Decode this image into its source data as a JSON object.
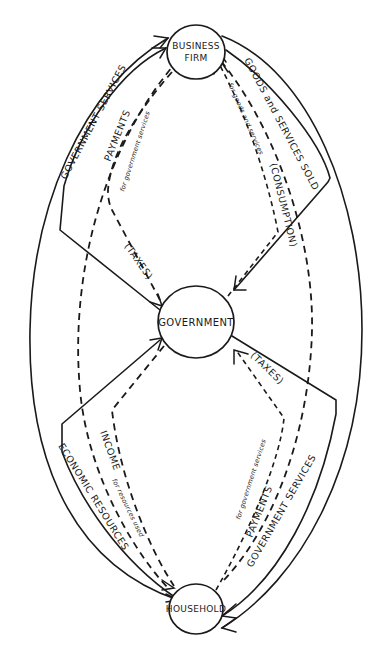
{
  "diagram": {
    "nodes": {
      "firm": {
        "line1": "BUSINESS",
        "line2": "FIRM"
      },
      "government": {
        "label": "GOVERNMENT"
      },
      "household": {
        "label": "HOUSEHOLD"
      }
    },
    "flows": {
      "gov_services_to_firm": {
        "label": "GOVERNMENT SERVICES",
        "style": "solid"
      },
      "firm_payments_to_gov": {
        "label": "PAYMENTS",
        "sublabel": "for government services",
        "style": "dashed"
      },
      "firm_taxes": {
        "label": "(TAXES)",
        "style": "dashed"
      },
      "goods_services_sold": {
        "label": "GOODS and SERVICES SOLD",
        "style": "solid"
      },
      "consumption_payments": {
        "label": "(CONSUMPTION)",
        "sublabel": "for goods and services",
        "style": "dashed"
      },
      "economic_resources": {
        "label": "ECONOMIC RESOURCES",
        "style": "solid"
      },
      "income": {
        "label": "INCOME",
        "sublabel": "for resources used",
        "style": "dashed"
      },
      "household_taxes": {
        "label": "(TAXES)",
        "style": "dashed"
      },
      "household_payments_to_gov": {
        "label": "PAYMENTS",
        "sublabel": "for government services",
        "style": "dashed"
      },
      "gov_services_to_household": {
        "label": "GOVERNMENT SERVICES",
        "style": "solid"
      }
    },
    "colors": {
      "ink": "#1a1a1a",
      "background": "#ffffff"
    }
  }
}
